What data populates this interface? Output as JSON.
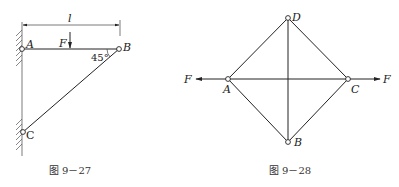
{
  "figures": [
    {
      "id": "fig-9-27",
      "caption": "图 9－27",
      "labels": {
        "length": "l",
        "force": "F",
        "angle": "45°",
        "A": "A",
        "B": "B",
        "C": "C"
      },
      "nodes": {
        "A": [
          22,
          49
        ],
        "B": [
          119,
          49
        ],
        "C": [
          23,
          132
        ]
      },
      "members": [
        [
          "A",
          "B"
        ],
        [
          "B",
          "C"
        ]
      ],
      "support": "wall"
    },
    {
      "id": "fig-9-28",
      "caption": "图 9－28",
      "labels": {
        "force_left": "F",
        "force_right": "F",
        "A": "A",
        "B": "B",
        "C": "C",
        "D": "D"
      },
      "nodes": {
        "A": [
          228,
          79
        ],
        "B": [
          288,
          142
        ],
        "C": [
          348,
          79
        ],
        "D": [
          288,
          18
        ]
      },
      "members": [
        [
          "A",
          "D"
        ],
        [
          "D",
          "C"
        ],
        [
          "C",
          "B"
        ],
        [
          "B",
          "A"
        ],
        [
          "A",
          "C"
        ],
        [
          "D",
          "B"
        ]
      ]
    }
  ]
}
